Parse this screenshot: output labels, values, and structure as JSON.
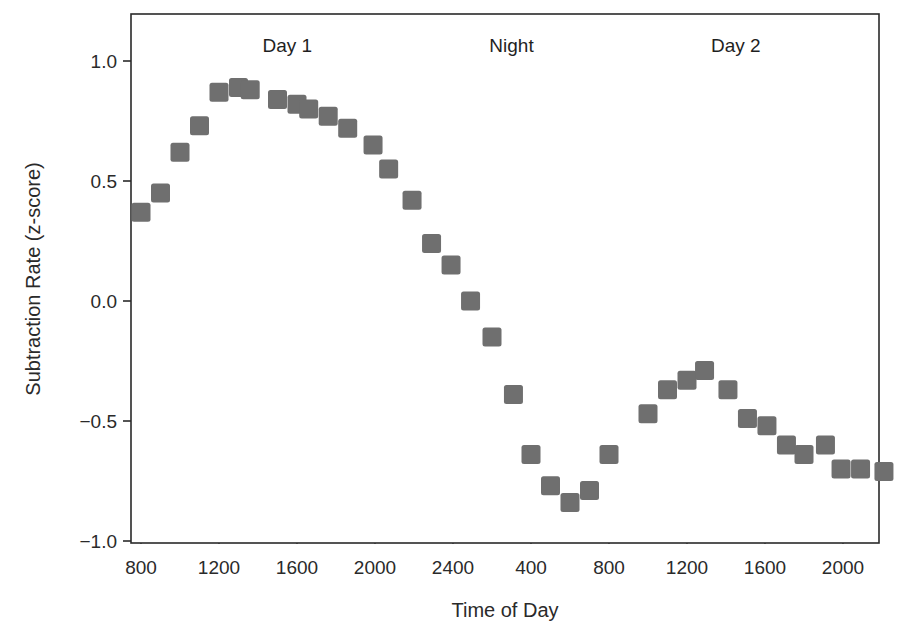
{
  "chart_data": {
    "type": "scatter",
    "title": "",
    "xlabel": "Time of Day",
    "ylabel": "Subtraction Rate (z-score)",
    "x_unit": "hours elapsed from 800 on Day 1",
    "xlim": [
      -0.5,
      37.8
    ],
    "ylim": [
      -1.02,
      1.2
    ],
    "grid": false,
    "marker": "square",
    "marker_color": "#6f6f6f",
    "x_ticks": [
      0,
      4,
      8,
      12,
      16,
      20,
      24,
      28,
      32,
      36
    ],
    "x_tick_labels": [
      "800",
      "1200",
      "1600",
      "2000",
      "2400",
      "400",
      "800",
      "1200",
      "1600",
      "2000"
    ],
    "y_ticks": [
      1.0,
      0.5,
      0.0,
      -0.5,
      -1.0
    ],
    "y_tick_labels": [
      "1.0",
      "0.5",
      "0.0",
      "−0.5",
      "−1.0"
    ],
    "annotations": [
      {
        "text": "Day 1",
        "x": 7.5,
        "y": 1.06
      },
      {
        "text": "Night",
        "x": 19.0,
        "y": 1.06
      },
      {
        "text": "Day 2",
        "x": 30.5,
        "y": 1.06
      }
    ],
    "points": [
      {
        "x": 0.0,
        "y": 0.37
      },
      {
        "x": 1.0,
        "y": 0.45
      },
      {
        "x": 2.0,
        "y": 0.62
      },
      {
        "x": 3.0,
        "y": 0.73
      },
      {
        "x": 4.0,
        "y": 0.87
      },
      {
        "x": 5.0,
        "y": 0.89
      },
      {
        "x": 5.6,
        "y": 0.88
      },
      {
        "x": 7.0,
        "y": 0.84
      },
      {
        "x": 8.0,
        "y": 0.82
      },
      {
        "x": 8.6,
        "y": 0.8
      },
      {
        "x": 9.6,
        "y": 0.77
      },
      {
        "x": 10.6,
        "y": 0.72
      },
      {
        "x": 11.9,
        "y": 0.65
      },
      {
        "x": 12.7,
        "y": 0.55
      },
      {
        "x": 13.9,
        "y": 0.42
      },
      {
        "x": 14.9,
        "y": 0.24
      },
      {
        "x": 15.9,
        "y": 0.15
      },
      {
        "x": 16.9,
        "y": 0.0
      },
      {
        "x": 18.0,
        "y": -0.15
      },
      {
        "x": 19.1,
        "y": -0.39
      },
      {
        "x": 20.0,
        "y": -0.64
      },
      {
        "x": 21.0,
        "y": -0.77
      },
      {
        "x": 22.0,
        "y": -0.84
      },
      {
        "x": 23.0,
        "y": -0.79
      },
      {
        "x": 24.0,
        "y": -0.64
      },
      {
        "x": 26.0,
        "y": -0.47
      },
      {
        "x": 27.0,
        "y": -0.37
      },
      {
        "x": 28.0,
        "y": -0.33
      },
      {
        "x": 28.9,
        "y": -0.29
      },
      {
        "x": 30.1,
        "y": -0.37
      },
      {
        "x": 31.1,
        "y": -0.49
      },
      {
        "x": 32.1,
        "y": -0.52
      },
      {
        "x": 33.1,
        "y": -0.6
      },
      {
        "x": 34.0,
        "y": -0.64
      },
      {
        "x": 35.1,
        "y": -0.6
      },
      {
        "x": 35.9,
        "y": -0.7
      },
      {
        "x": 36.9,
        "y": -0.7
      },
      {
        "x": 38.1,
        "y": -0.71
      }
    ]
  }
}
